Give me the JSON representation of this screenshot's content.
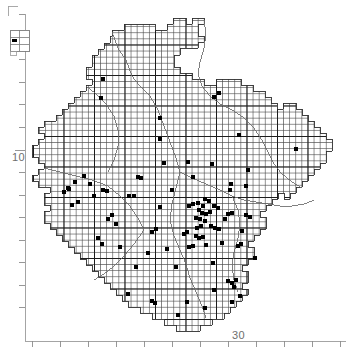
{
  "figure": {
    "type": "distribution-dot-map",
    "background_color": "#ffffff",
    "line_color": "#3a3a3a",
    "grid_color": "#555555",
    "axis_color": "#8c8c8c",
    "dot_color": "#000000",
    "width": 346,
    "height": 347
  },
  "axes": {
    "vertical": {
      "label": "10",
      "label_x": 12,
      "label_y": 161,
      "tick_count": 14,
      "ticks": [
        14,
        37,
        59,
        82,
        104,
        127,
        150,
        172,
        195,
        217,
        240,
        262,
        285,
        307
      ],
      "major_tick_index": 6,
      "axis_x": 25
    },
    "horizontal": {
      "label": "30",
      "label_x": 232,
      "label_y": 339,
      "tick_count": 12,
      "ticks": [
        32,
        60,
        88,
        116,
        144,
        172,
        200,
        228,
        256,
        284,
        312,
        340
      ],
      "major_tick_index": 4,
      "axis_y": 341
    },
    "corner_mark": {
      "x": 8,
      "y": 6,
      "size": 10
    }
  },
  "legend": {
    "name": "grid-square-legend",
    "x": 10,
    "y": 30,
    "width": 19,
    "height": 21,
    "cols": 2,
    "rows": 3,
    "marker": "filled-square-dot",
    "marker_cell": [
      0,
      1
    ],
    "caption": ""
  },
  "grid": {
    "cell_size": 6.1,
    "major_every": 5,
    "origin_x": 33,
    "origin_y": 14,
    "description": "10 km grid squares with bold 50 km lines"
  },
  "chart_data": {
    "type": "scatter",
    "title": "",
    "xlabel": "",
    "ylabel": "",
    "legend": "Records plotted on 10 km squares",
    "region_outline_name": "survey-region-boundary",
    "dot_count": 97,
    "dots": [
      [
        103,
        79
      ],
      [
        101,
        98
      ],
      [
        160,
        118
      ],
      [
        160,
        139
      ],
      [
        214,
        97
      ],
      [
        219,
        93
      ],
      [
        239,
        135
      ],
      [
        212,
        164
      ],
      [
        164,
        163
      ],
      [
        188,
        162
      ],
      [
        193,
        177
      ],
      [
        248,
        170
      ],
      [
        296,
        149
      ],
      [
        75,
        182
      ],
      [
        84,
        176
      ],
      [
        90,
        184
      ],
      [
        69,
        189
      ],
      [
        94,
        196
      ],
      [
        78,
        202
      ],
      [
        72,
        205
      ],
      [
        103,
        190
      ],
      [
        107,
        191
      ],
      [
        129,
        196
      ],
      [
        134,
        196
      ],
      [
        231,
        184
      ],
      [
        230,
        190
      ],
      [
        138,
        177
      ],
      [
        141,
        178
      ],
      [
        189,
        206
      ],
      [
        193,
        204
      ],
      [
        198,
        203
      ],
      [
        203,
        206
      ],
      [
        199,
        210
      ],
      [
        205,
        199
      ],
      [
        209,
        201
      ],
      [
        202,
        213
      ],
      [
        206,
        214
      ],
      [
        210,
        212
      ],
      [
        196,
        218
      ],
      [
        200,
        219
      ],
      [
        205,
        221
      ],
      [
        214,
        206
      ],
      [
        218,
        208
      ],
      [
        228,
        214
      ],
      [
        232,
        213
      ],
      [
        197,
        228
      ],
      [
        201,
        226
      ],
      [
        211,
        226
      ],
      [
        215,
        228
      ],
      [
        219,
        229
      ],
      [
        196,
        236
      ],
      [
        199,
        238
      ],
      [
        203,
        237
      ],
      [
        189,
        247
      ],
      [
        193,
        246
      ],
      [
        187,
        232
      ],
      [
        184,
        234
      ],
      [
        225,
        219
      ],
      [
        246,
        215
      ],
      [
        250,
        217
      ],
      [
        242,
        231
      ],
      [
        238,
        246
      ],
      [
        241,
        244
      ],
      [
        156,
        229
      ],
      [
        152,
        232
      ],
      [
        120,
        247
      ],
      [
        167,
        249
      ],
      [
        176,
        267
      ],
      [
        213,
        263
      ],
      [
        228,
        281
      ],
      [
        232,
        283
      ],
      [
        236,
        280
      ],
      [
        234,
        287
      ],
      [
        187,
        302
      ],
      [
        152,
        301
      ],
      [
        155,
        303
      ],
      [
        128,
        294
      ],
      [
        240,
        296
      ],
      [
        68,
        188
      ],
      [
        64,
        192
      ],
      [
        112,
        215
      ],
      [
        108,
        219
      ],
      [
        116,
        224
      ],
      [
        98,
        238
      ],
      [
        102,
        244
      ],
      [
        172,
        190
      ],
      [
        246,
        186
      ],
      [
        160,
        207
      ],
      [
        148,
        253
      ],
      [
        136,
        267
      ],
      [
        206,
        245
      ],
      [
        222,
        243
      ],
      [
        255,
        258
      ],
      [
        214,
        290
      ],
      [
        205,
        308
      ],
      [
        178,
        315
      ],
      [
        232,
        302
      ]
    ],
    "xlim": [
      0,
      346
    ],
    "ylim": [
      0,
      347
    ],
    "grid": true,
    "legend_position": "top-left"
  }
}
